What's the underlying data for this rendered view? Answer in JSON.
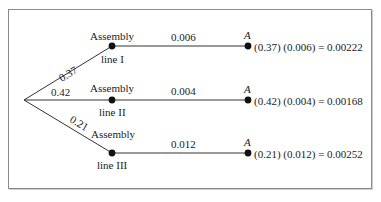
{
  "diagram": {
    "type": "probability-tree",
    "root": {},
    "branches": [
      {
        "id": "line-1",
        "prob_label": "0.37",
        "node_top_label": "Assembly",
        "node_bottom_label": "line I",
        "defect_prob_label": "0.006",
        "outcome_label": "A",
        "result_label": "(0.37) (0.006) = 0.00222"
      },
      {
        "id": "line-2",
        "prob_label": "0.42",
        "node_top_label": "Assembly",
        "node_bottom_label": "line II",
        "defect_prob_label": "0.004",
        "outcome_label": "A",
        "result_label": "(0.42) (0.004) = 0.00168"
      },
      {
        "id": "line-3",
        "prob_label": "0.21",
        "node_top_label": "Assembly",
        "node_bottom_label": "line III",
        "defect_prob_label": "0.012",
        "outcome_label": "A",
        "result_label": "(0.21) (0.012) = 0.00252"
      }
    ],
    "colors": {
      "line": "#333333",
      "node": "#111111",
      "frame": "#8a8a8a",
      "text": "#222222"
    }
  }
}
